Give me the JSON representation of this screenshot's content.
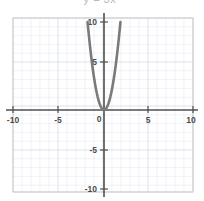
{
  "chart_data": {
    "type": "line",
    "title": "y = 3x²",
    "xlabel": "",
    "ylabel": "",
    "xlim": [
      -10,
      10
    ],
    "ylim": [
      -10,
      10
    ],
    "grid": true,
    "grid_minor_step": 1,
    "grid_major_step": 5,
    "legend": "none",
    "equation": "y = 3x²",
    "x_ticks": [
      -10,
      -5,
      0,
      5,
      10
    ],
    "x_tick_labels": [
      "-10",
      "-5",
      "0",
      "5",
      "10"
    ],
    "y_ticks": [
      10,
      5,
      -5,
      -10
    ],
    "y_tick_labels": [
      "10",
      "5",
      "-5",
      "-10"
    ],
    "series": [
      {
        "name": "y = 3x²",
        "color": "#7a7a7a",
        "x": [
          -1.83,
          -1.7,
          -1.6,
          -1.5,
          -1.4,
          -1.3,
          -1.2,
          -1.1,
          -1.0,
          -0.9,
          -0.8,
          -0.7,
          -0.6,
          -0.5,
          -0.4,
          -0.3,
          -0.2,
          -0.1,
          0.0,
          0.1,
          0.2,
          0.3,
          0.4,
          0.5,
          0.6,
          0.7,
          0.8,
          0.9,
          1.0,
          1.1,
          1.2,
          1.3,
          1.4,
          1.5,
          1.6,
          1.7,
          1.83
        ],
        "y": [
          10.0,
          8.67,
          7.68,
          6.75,
          5.88,
          5.07,
          4.32,
          3.63,
          3.0,
          2.43,
          1.92,
          1.47,
          1.08,
          0.75,
          0.48,
          0.27,
          0.12,
          0.03,
          0.0,
          0.03,
          0.12,
          0.27,
          0.48,
          0.75,
          1.08,
          1.47,
          1.92,
          2.43,
          3.0,
          3.63,
          4.32,
          5.07,
          5.88,
          6.75,
          7.68,
          8.67,
          10.0
        ]
      }
    ],
    "vertex": [
      0,
      0
    ],
    "colors": {
      "curve": "#7a7a7a",
      "axis": "#4f4f4f",
      "grid_minor": "#e4e8ef",
      "grid_major": "#ccd3de",
      "frame": "#c9c9c9",
      "background": "#ffffff",
      "tick_label": "#4a4a4a"
    }
  }
}
